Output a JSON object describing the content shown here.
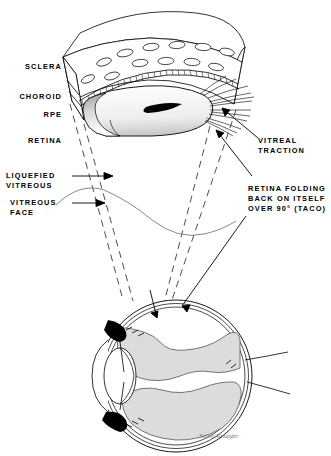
{
  "figure": {
    "background_color": "#ffffff",
    "ink_color": "#000000",
    "tissue_fill_color": "#dcdcdc",
    "signature": "Norris/Alexander"
  },
  "labels": {
    "sclera": "SCLERA",
    "choroid": "CHOROID",
    "rpe": "RPE",
    "retina": "RETINA",
    "liquefied_vitreous_line1": "LIQUEFIED",
    "liquefied_vitreous_line2": "VITREOUS",
    "vitreous_face_line1": "VITREOUS",
    "vitreous_face_line2": "FACE",
    "vitreal_traction_line1": "VITREAL",
    "vitreal_traction_line2": "TRACTION",
    "retina_folding_line1": "RETINA FOLDING",
    "retina_folding_line2": "BACK ON ITSELF",
    "retina_folding_line3": "OVER 90° (TACO)"
  },
  "panels": {
    "upper": "magnified cutaway block of eye wall showing folded retina",
    "lower": "whole globe cross-section showing detached retina"
  }
}
